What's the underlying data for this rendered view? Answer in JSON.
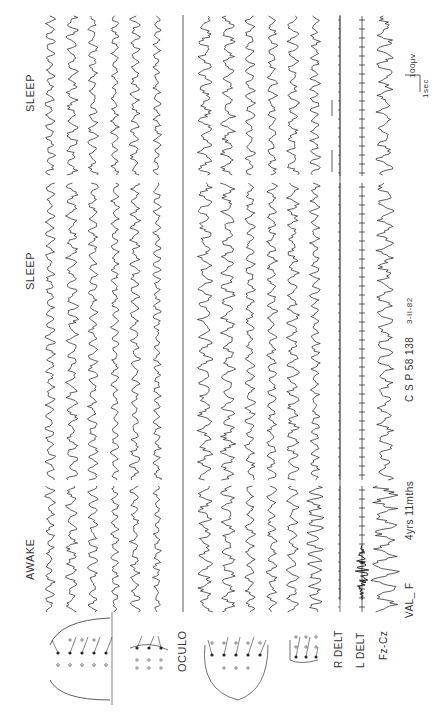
{
  "record": {
    "patient": "VAL_ F",
    "age": "4yrs 11mths",
    "record_id": "C S P 58 138",
    "date": "3-II-82"
  },
  "states": [
    {
      "label": "AWAKE"
    },
    {
      "label": "SLEEP"
    },
    {
      "label": "SLEEP"
    }
  ],
  "channels": {
    "group1_label": "",
    "oculo_label": "OCULO",
    "r_delt_label": "R DELT",
    "l_delt_label": "L DELT",
    "fz_cz_label": "Fz-Cz"
  },
  "scale": {
    "time_label": "1sec",
    "amplitude_label": "100µv"
  },
  "colors": {
    "trace": "#1a1a1a",
    "background": "#ffffff"
  }
}
